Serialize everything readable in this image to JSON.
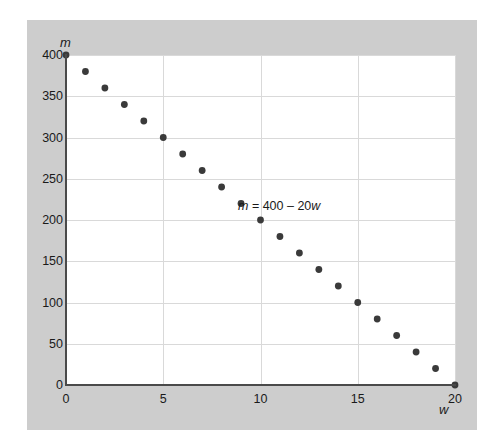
{
  "figure": {
    "background_color": "#cdcdcd",
    "plot_background_color": "#ffffff",
    "axis_color": "#4a4a4a",
    "grid_color": "#d9d9d9",
    "point_color": "#3a3a3a"
  },
  "axis_labels": {
    "y": "m",
    "x": "w"
  },
  "annotation": {
    "full": "m = 400 – 20w",
    "lhs": "m",
    "operator": " = 400 – 20",
    "rhs": "w"
  },
  "chart_data": {
    "type": "scatter",
    "title": "",
    "xlabel": "w",
    "ylabel": "m",
    "xlim": [
      0,
      20
    ],
    "ylim": [
      0,
      400
    ],
    "grid": true,
    "legend": "none",
    "equation": "m = 400 – 20w",
    "x_ticks": [
      0,
      5,
      10,
      15,
      20
    ],
    "x_tick_labels": [
      "0",
      "5",
      "10",
      "15",
      "20"
    ],
    "y_ticks": [
      0,
      50,
      100,
      150,
      200,
      250,
      300,
      350,
      400
    ],
    "y_tick_labels": [
      "0",
      "50",
      "100",
      "150",
      "200",
      "250",
      "300",
      "350",
      "400"
    ],
    "series": [
      {
        "name": "m = 400 - 20w",
        "x": [
          0,
          1,
          2,
          3,
          4,
          5,
          6,
          7,
          8,
          9,
          10,
          11,
          12,
          13,
          14,
          15,
          16,
          17,
          18,
          19,
          20
        ],
        "values": [
          400,
          380,
          360,
          340,
          320,
          300,
          280,
          260,
          240,
          220,
          200,
          180,
          160,
          140,
          120,
          100,
          80,
          60,
          40,
          20,
          0
        ],
        "marker": "circle",
        "color": "#3a3a3a"
      }
    ]
  }
}
